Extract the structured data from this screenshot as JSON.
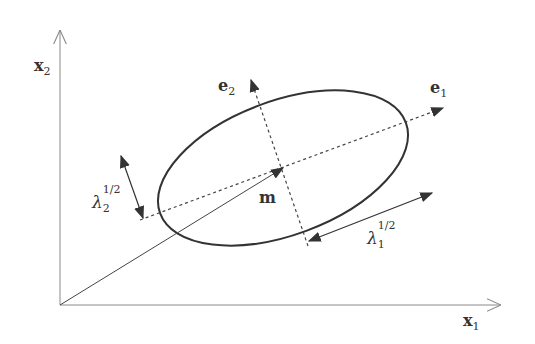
{
  "diagram": {
    "title": "",
    "axes": {
      "x_label_main": "x",
      "x_label_sub": "1",
      "y_label_main": "x",
      "y_label_sub": "2"
    },
    "eigenvectors": {
      "e1_main": "e",
      "e1_sub": "1",
      "e2_main": "e",
      "e2_sub": "2"
    },
    "mean_label": "m",
    "lambda1": {
      "symbol": "λ",
      "sub": "1",
      "sup": "1/2"
    },
    "lambda2": {
      "symbol": "λ",
      "sub": "2",
      "sup": "1/2"
    },
    "colors": {
      "axis": "#8a8a8a",
      "ellipse": "#333333",
      "arrow": "#333333",
      "dotted": "#444444",
      "text": "#333333"
    },
    "geometry": {
      "origin": [
        60,
        305
      ],
      "mean": [
        283,
        168
      ],
      "ellipse_rotation_deg": -20.3,
      "ellipse_semi_major": 131,
      "ellipse_semi_minor": 67
    }
  }
}
